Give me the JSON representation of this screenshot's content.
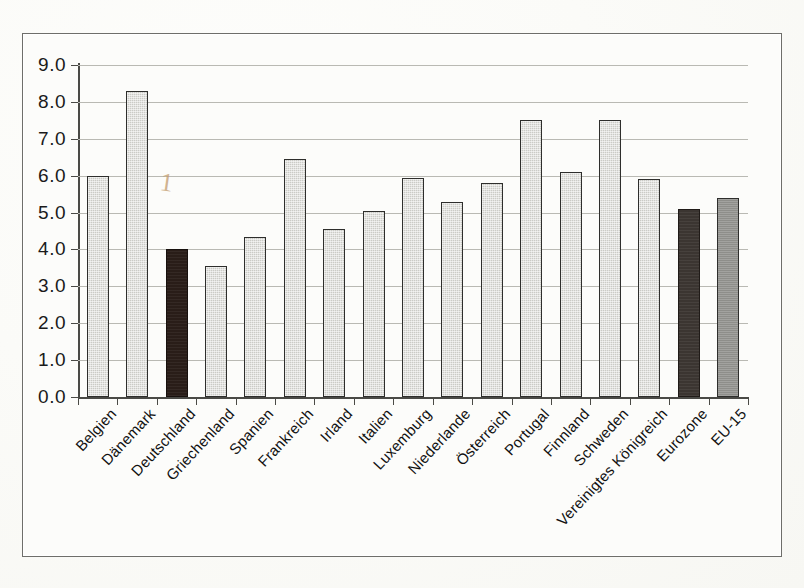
{
  "chart_data": {
    "type": "bar",
    "title": "",
    "xlabel": "",
    "ylabel": "",
    "ylim": [
      0.0,
      9.0
    ],
    "ytick_labels": [
      "9.0",
      "8.0",
      "7.0",
      "6.0",
      "5.0",
      "4.0",
      "3.0",
      "2.0",
      "1.0",
      "0.0"
    ],
    "ytick_values": [
      9.0,
      8.0,
      7.0,
      6.0,
      5.0,
      4.0,
      3.0,
      2.0,
      1.0,
      0.0
    ],
    "grid": true,
    "legend": "none",
    "categories": [
      "Belgien",
      "Dänemark",
      "Deutschland",
      "Griechenland",
      "Spanien",
      "Frankreich",
      "Irland",
      "Italien",
      "Luxemburg",
      "Niederlande",
      "Österreich",
      "Portugal",
      "Finnland",
      "Schweden",
      "Vereinigtes Königreich",
      "Eurozone",
      "EU-15"
    ],
    "values": [
      6.0,
      8.3,
      4.0,
      3.55,
      4.35,
      6.45,
      4.55,
      5.05,
      5.95,
      5.3,
      5.8,
      7.5,
      6.1,
      7.5,
      5.9,
      5.1,
      5.4
    ],
    "bar_styles": [
      "light",
      "light",
      "dark",
      "light",
      "light",
      "light",
      "light",
      "light",
      "light",
      "light",
      "light",
      "light",
      "light",
      "light",
      "light",
      "mid",
      "gray"
    ],
    "colors": {
      "light_bar": "#cbcbc6",
      "highlight_bar": "#291d18",
      "aggregate_bar": "#3b3531",
      "eu15_bar": "#8e8e8a",
      "axis": "#4a4a46",
      "gridline": "#b9b9b3",
      "background": "#fcfcfa",
      "pencil_mark": "#c39b6d"
    }
  },
  "annotations": {
    "pencil_mark": "1"
  }
}
